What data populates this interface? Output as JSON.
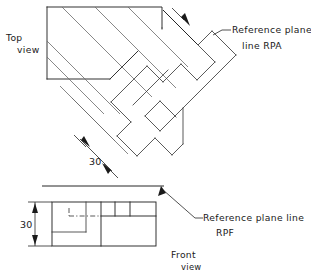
{
  "drawing": {
    "title": "Reference plane construction - top and front views",
    "colors": {
      "object_line": "#3c3c3c",
      "object_line_dark": "#262626",
      "projection_line": "#6a6a6a",
      "text": "#1a1a1a",
      "background": "#ffffff"
    }
  },
  "labels": {
    "top_view_line1": "Top",
    "top_view_line2": "view",
    "front_view_line1": "Front",
    "front_view_line2": "view",
    "rpa_line1": "Reference plane",
    "rpa_line2": "line RPA",
    "rpf_line1": "Reference plane line",
    "rpf_line2": "RPF"
  },
  "dimensions": {
    "top_view_30": "30",
    "front_view_30": "30"
  },
  "icons": {
    "arrow_rpa": "arrow-head-icon",
    "arrow_rpf": "arrow-head-icon",
    "dim_arrow_top_upper": "dimension-arrow-icon",
    "dim_arrow_top_lower": "dimension-arrow-icon",
    "dim_arrow_front_top": "dimension-arrow-icon",
    "dim_arrow_front_bottom": "dimension-arrow-icon"
  }
}
